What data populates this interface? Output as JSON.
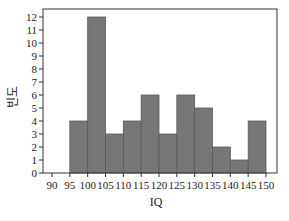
{
  "chart_data": {
    "type": "bar",
    "subtype": "histogram",
    "title": "",
    "xlabel": "IQ",
    "ylabel": "빈도",
    "bin_edges": [
      95,
      100,
      105,
      110,
      115,
      120,
      125,
      130,
      135,
      140,
      145,
      150
    ],
    "categories": [
      "95-100",
      "100-105",
      "105-110",
      "110-115",
      "115-120",
      "120-125",
      "125-130",
      "130-135",
      "135-140",
      "140-145",
      "145-150"
    ],
    "values": [
      4,
      12,
      3,
      4,
      6,
      3,
      6,
      5,
      2,
      1,
      4
    ],
    "xlim": [
      87.5,
      152.5
    ],
    "ylim": [
      0,
      12
    ],
    "x_ticks": [
      90,
      95,
      100,
      105,
      110,
      115,
      120,
      125,
      130,
      135,
      140,
      145,
      150
    ],
    "y_ticks": [
      0,
      1,
      2,
      3,
      4,
      5,
      6,
      7,
      8,
      9,
      10,
      11,
      12
    ],
    "grid": false,
    "legend": null,
    "bar_color": "#777777",
    "bar_edge_color": "#5a5a5a"
  }
}
